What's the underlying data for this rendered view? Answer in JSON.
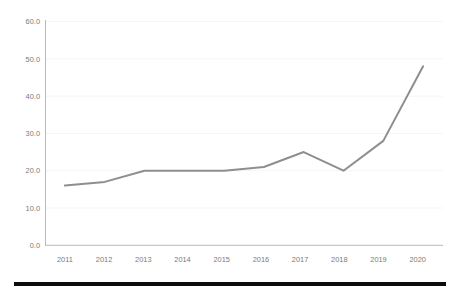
{
  "chart_data": {
    "type": "line",
    "title": "",
    "subtitle": "",
    "xlabel": "",
    "ylabel": "",
    "categories": [
      "2011",
      "2012",
      "2013",
      "2014",
      "2015",
      "2016",
      "2017",
      "2018",
      "2019",
      "2020"
    ],
    "x": [
      2011,
      2012,
      2013,
      2014,
      2015,
      2016,
      2017,
      2018,
      2019,
      2020
    ],
    "values": [
      16,
      17,
      20,
      20,
      20,
      21,
      25,
      20,
      28,
      48
    ],
    "series": [
      {
        "name": "",
        "values": [
          16,
          17,
          20,
          20,
          20,
          21,
          25,
          20,
          28,
          48
        ],
        "color": "#8e8e8e"
      }
    ],
    "ylim": [
      0,
      60
    ],
    "yticks": [
      0,
      10,
      20,
      30,
      40,
      50,
      60
    ],
    "ytick_labels": [
      "0.0",
      "10.0",
      "20.0",
      "30.0",
      "40.0",
      "50.0",
      "60.0"
    ],
    "xtick_labels": [
      "2011",
      "2012",
      "2013",
      "2014",
      "2015",
      "2016",
      "2017",
      "2018",
      "2019",
      "2020"
    ],
    "grid": true,
    "grid_axis": "y",
    "legend": false,
    "legend_position": "none",
    "annotations": []
  },
  "colors": {
    "background": "#ffffff",
    "series": "#8e8e8e",
    "gridline": "#f2f2f2",
    "axis": "#b9b9b9",
    "tick_text": "#7a7a7a",
    "footer_bar": "#0d0d0d"
  },
  "footer": {
    "bar_label": "bottom-rule"
  }
}
